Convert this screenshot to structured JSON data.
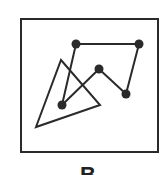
{
  "figure": {
    "label": "B",
    "frame": {
      "x": 21,
      "y": 19,
      "width": 137,
      "height": 133
    },
    "triangle": [
      [
        61,
        60
      ],
      [
        100,
        105
      ],
      [
        36,
        127
      ]
    ],
    "path": [
      [
        139,
        44
      ],
      [
        76,
        44
      ],
      [
        62,
        105
      ],
      [
        99,
        69
      ],
      [
        126,
        94
      ],
      [
        139,
        44
      ]
    ],
    "dots": [
      [
        76,
        44
      ],
      [
        139,
        44
      ],
      [
        99,
        69
      ],
      [
        126,
        94
      ],
      [
        62,
        105
      ]
    ],
    "colors": {
      "stroke": "#2a2a2a",
      "background": "#ffffff"
    }
  }
}
